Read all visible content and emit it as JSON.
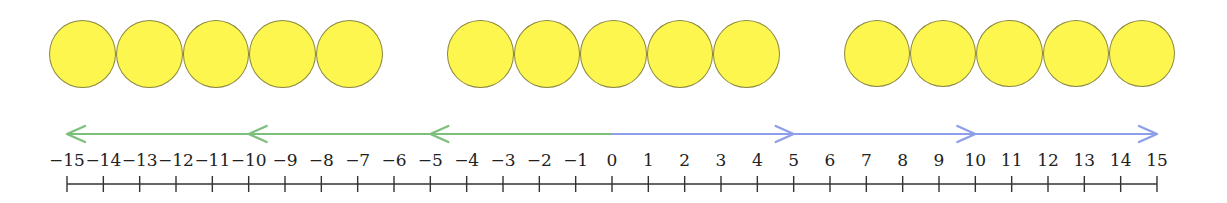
{
  "diagram": {
    "type": "number-line-with-counters",
    "counter_color": "#fdf64f",
    "counter_stroke": "#8a8540",
    "counter_groups": [
      {
        "name": "group-1",
        "count": 5,
        "x_start": 49,
        "x_end": 383
      },
      {
        "name": "group-2",
        "count": 5,
        "x_start": 447,
        "x_end": 780
      },
      {
        "name": "group-3",
        "count": 5,
        "x_start": 844,
        "x_end": 1175
      }
    ],
    "number_line": {
      "min": -15,
      "max": 15,
      "step": 1,
      "labels": [
        "−15",
        "−14",
        "−13",
        "−12",
        "−11",
        "−10",
        "−9",
        "−8",
        "−7",
        "−6",
        "−5",
        "−4",
        "−3",
        "−2",
        "−1",
        "0",
        "1",
        "2",
        "3",
        "4",
        "5",
        "6",
        "7",
        "8",
        "9",
        "10",
        "11",
        "12",
        "13",
        "14",
        "15"
      ]
    },
    "arrows": [
      {
        "name": "green-arrow-1",
        "from": 0,
        "to": -5,
        "color": "#7dbf7d"
      },
      {
        "name": "green-arrow-2",
        "from": -5,
        "to": -10,
        "color": "#7dbf7d"
      },
      {
        "name": "green-arrow-3",
        "from": -10,
        "to": -15,
        "color": "#7dbf7d"
      },
      {
        "name": "blue-arrow-1",
        "from": 0,
        "to": 5,
        "color": "#8f9ee8"
      },
      {
        "name": "blue-arrow-2",
        "from": 5,
        "to": 10,
        "color": "#8f9ee8"
      },
      {
        "name": "blue-arrow-3",
        "from": 10,
        "to": 15,
        "color": "#8f9ee8"
      }
    ]
  }
}
